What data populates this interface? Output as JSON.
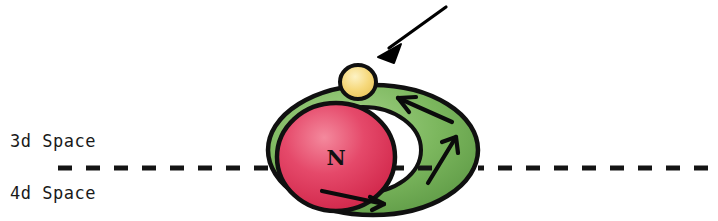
{
  "figure": {
    "title_visible": false,
    "background_color": "#ffffff",
    "labels": {
      "space_3d": "3d Space",
      "space_4d": "4d Space",
      "nucleus": "N"
    },
    "elements": {
      "torus_ring": {
        "name": "green-torus",
        "fill_color": "#7ab55c",
        "highlight_color": "#9fcf83",
        "outline_color": "#101010"
      },
      "nucleus_sphere": {
        "name": "red-sphere",
        "fill_color": "#e03a5a",
        "highlight_color": "#f2758c",
        "outline_color": "#101010",
        "label": "N"
      },
      "particle_sphere": {
        "name": "yellow-sphere",
        "fill_color": "#f5d97a",
        "highlight_color": "#fcefb8",
        "outline_color": "#101010"
      },
      "pointer_arrow": {
        "name": "pointer-arrow",
        "color": "#000000",
        "direction": "down-left"
      },
      "flow_arrows": {
        "name": "flow-arrows",
        "color": "#000000",
        "count": 3,
        "direction": "counterclockwise"
      },
      "boundary_line": {
        "name": "dashed-boundary-line",
        "color": "#141414",
        "style": "dashed",
        "dash_length": 14,
        "gap_length": 14,
        "y_position": 168
      }
    }
  }
}
